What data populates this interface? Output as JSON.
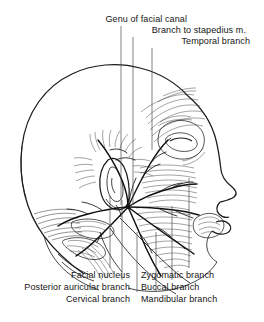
{
  "figure": {
    "ink_color": "#1b1b1b",
    "background_color": "#ffffff",
    "leader_color": "#4a4a4a"
  },
  "labels": {
    "top": [
      {
        "id": "genu-of-facial-canal",
        "text": "Genu of facial canal",
        "x": 187,
        "y": 14,
        "align": "right",
        "leader_x": 121,
        "leader_y1": 26,
        "leader_y2": 205
      },
      {
        "id": "branch-to-stapedius",
        "text": "Branch to stapedius m.",
        "x": 246,
        "y": 25,
        "align": "right",
        "leader_x": 133,
        "leader_y1": 37,
        "leader_y2": 205
      },
      {
        "id": "temporal-branch",
        "text": "Temporal branch",
        "x": 250,
        "y": 36,
        "align": "right",
        "leader_x": 152,
        "leader_y1": 48,
        "leader_y2": 150
      }
    ],
    "bottom": [
      {
        "id": "facial-nucleus",
        "text": "Facial nucleus",
        "x": 130,
        "y": 270,
        "align": "right",
        "leader_x": 110,
        "leader_y1": 268,
        "leader_y2": 196
      },
      {
        "id": "posterior-auricular-branch",
        "text": "Posterior auricular branch",
        "x": 130,
        "y": 282,
        "align": "right",
        "leader_x": 122,
        "leader_y1": 280,
        "leader_y2": 200
      },
      {
        "id": "cervical-branch",
        "text": "Cervical branch",
        "x": 130,
        "y": 294,
        "align": "right",
        "leader_x": 137,
        "leader_y1": 292,
        "leader_y2": 232
      },
      {
        "id": "zygomatic-branch",
        "text": "Zygomatic branch",
        "x": 141,
        "y": 270,
        "align": "left",
        "leader_x": 189,
        "leader_y1": 268,
        "leader_y2": 178
      },
      {
        "id": "buccal-branch",
        "text": "Buccal branch",
        "x": 141,
        "y": 282,
        "align": "left",
        "leader_x": 172,
        "leader_y1": 280,
        "leader_y2": 206
      },
      {
        "id": "mandibular-branch",
        "text": "Mandibular branch",
        "x": 141,
        "y": 294,
        "align": "left",
        "leader_x": 156,
        "leader_y1": 292,
        "leader_y2": 232
      }
    ]
  }
}
